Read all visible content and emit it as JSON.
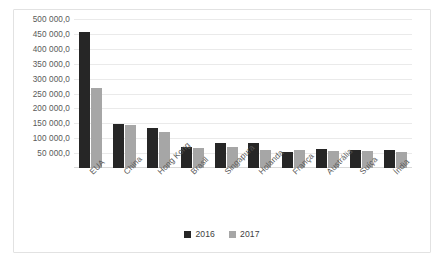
{
  "chart_data": {
    "type": "bar",
    "title": "",
    "subtitle": "",
    "xlabel": "",
    "ylabel": "",
    "grid": true,
    "legend_position": "bottom",
    "ylim": [
      0,
      500000
    ],
    "ytick_step": 50000,
    "ytick_labels": [
      "500 000,0",
      "450 000,0",
      "400 000,0",
      "350 000,0",
      "300 000,0",
      "250 000,0",
      "200 000,0",
      "150 000,0",
      "100 000,0",
      "50 000,0"
    ],
    "ytick_values": [
      500000,
      450000,
      400000,
      350000,
      300000,
      250000,
      200000,
      150000,
      100000,
      50000
    ],
    "categories": [
      "EUA",
      "China",
      "Hong Kong",
      "Brasil",
      "Singapura",
      "Holanda",
      "França",
      "Austrália",
      "Suíça",
      "Índia"
    ],
    "series": [
      {
        "name": "2016",
        "color": "#262626",
        "values": [
          455000,
          147000,
          135000,
          70000,
          85000,
          85000,
          54000,
          64000,
          62000,
          60000
        ]
      },
      {
        "name": "2017",
        "color": "#a6a6a6",
        "values": [
          270000,
          145000,
          120000,
          68000,
          72000,
          60000,
          60000,
          57000,
          57000,
          55000
        ]
      }
    ]
  },
  "legend": {
    "items": [
      {
        "label": "2016",
        "color": "#262626"
      },
      {
        "label": "2017",
        "color": "#a6a6a6"
      }
    ]
  },
  "colors": {
    "series_2016": "#262626",
    "series_2017": "#a6a6a6",
    "gridline": "#eaeaea",
    "frame_border": "#e2e2e2",
    "text": "#595959",
    "background": "#ffffff"
  }
}
